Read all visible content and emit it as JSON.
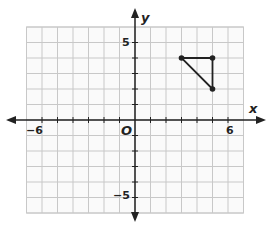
{
  "chart_data": {
    "type": "scatter",
    "title": "",
    "xlabel": "x",
    "ylabel": "y",
    "xlim": [
      -7,
      7
    ],
    "ylim": [
      -6,
      6
    ],
    "grid": true,
    "origin_label": "O",
    "tick_labels": {
      "x": [
        {
          "value": -6,
          "label": "−6"
        },
        {
          "value": 6,
          "label": "6"
        }
      ],
      "y": [
        {
          "value": 5,
          "label": "5"
        },
        {
          "value": -5,
          "label": "−5"
        }
      ]
    },
    "series": [
      {
        "name": "triangle",
        "shape": "polygon",
        "closed": true,
        "points": [
          [
            3,
            4
          ],
          [
            5,
            4
          ],
          [
            5,
            2
          ]
        ]
      }
    ]
  },
  "labels": {
    "x_axis": "x",
    "y_axis": "y",
    "origin": "O",
    "x_neg6": "−6",
    "x_pos6": "6",
    "y_pos5": "5",
    "y_neg5": "−5"
  },
  "colors": {
    "grid": "#c8c8c8",
    "axis": "#222222",
    "shape": "#222222",
    "background": "#ffffff"
  }
}
